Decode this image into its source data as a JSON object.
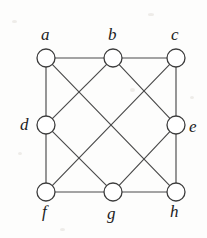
{
  "figure": {
    "background_color": "#fdfdfc",
    "edge_color": "#4a4a4a",
    "vertex_fill": "#ffffff",
    "vertex_stroke": "#3c3c3c",
    "label_color": "#1c1c1c"
  },
  "chart_data": {
    "type": "diagram",
    "layout": "3x3 grid with empty center",
    "vertex_radius": 9,
    "nodes": [
      {
        "id": "a",
        "label": "a",
        "x": 46,
        "y": 58,
        "degree": 3,
        "label_x": 41,
        "label_y": 26
      },
      {
        "id": "b",
        "label": "b",
        "x": 113,
        "y": 58,
        "degree": 4,
        "label_x": 108,
        "label_y": 26
      },
      {
        "id": "c",
        "label": "c",
        "x": 176,
        "y": 58,
        "degree": 3,
        "label_x": 171,
        "label_y": 26
      },
      {
        "id": "d",
        "label": "d",
        "x": 46,
        "y": 125,
        "degree": 4,
        "label_x": 20,
        "label_y": 116
      },
      {
        "id": "e",
        "label": "e",
        "x": 176,
        "y": 125,
        "degree": 4,
        "label_x": 189,
        "label_y": 118
      },
      {
        "id": "f",
        "label": "f",
        "x": 46,
        "y": 192,
        "degree": 3,
        "label_x": 42,
        "label_y": 203
      },
      {
        "id": "g",
        "label": "g",
        "x": 113,
        "y": 192,
        "degree": 4,
        "label_x": 107,
        "label_y": 205
      },
      {
        "id": "h",
        "label": "h",
        "x": 176,
        "y": 192,
        "degree": 3,
        "label_x": 170,
        "label_y": 203
      }
    ],
    "edges": [
      {
        "source": "a",
        "target": "b",
        "kind": "horizontal"
      },
      {
        "source": "b",
        "target": "c",
        "kind": "horizontal"
      },
      {
        "source": "f",
        "target": "g",
        "kind": "horizontal"
      },
      {
        "source": "g",
        "target": "h",
        "kind": "horizontal"
      },
      {
        "source": "a",
        "target": "d",
        "kind": "vertical"
      },
      {
        "source": "d",
        "target": "f",
        "kind": "vertical"
      },
      {
        "source": "c",
        "target": "e",
        "kind": "vertical"
      },
      {
        "source": "e",
        "target": "h",
        "kind": "vertical"
      },
      {
        "source": "d",
        "target": "b",
        "kind": "diagonal"
      },
      {
        "source": "b",
        "target": "e",
        "kind": "diagonal"
      },
      {
        "source": "d",
        "target": "g",
        "kind": "diagonal"
      },
      {
        "source": "g",
        "target": "e",
        "kind": "diagonal"
      },
      {
        "source": "a",
        "target": "h",
        "kind": "long-diagonal"
      },
      {
        "source": "c",
        "target": "f",
        "kind": "long-diagonal"
      }
    ],
    "node_count": 8,
    "edge_count": 14
  }
}
